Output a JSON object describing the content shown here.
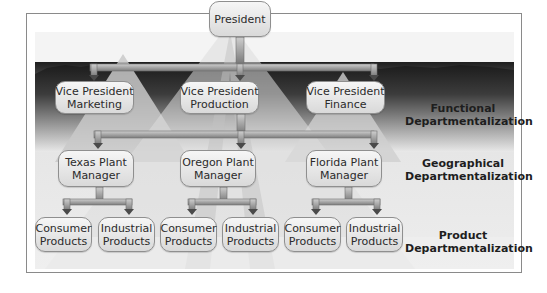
{
  "diagram": {
    "top": {
      "line1": "President"
    },
    "vps": [
      {
        "line1": "Vice President",
        "line2": "Marketing"
      },
      {
        "line1": "Vice President",
        "line2": "Production"
      },
      {
        "line1": "Vice President",
        "line2": "Finance"
      }
    ],
    "plants": [
      {
        "line1": "Texas Plant",
        "line2": "Manager"
      },
      {
        "line1": "Oregon Plant",
        "line2": "Manager"
      },
      {
        "line1": "Florida Plant",
        "line2": "Manager"
      }
    ],
    "products": [
      {
        "line1": "Consumer",
        "line2": "Products"
      },
      {
        "line1": "Industrial",
        "line2": "Products"
      },
      {
        "line1": "Consumer",
        "line2": "Products"
      },
      {
        "line1": "Industrial",
        "line2": "Products"
      },
      {
        "line1": "Consumer",
        "line2": "Products"
      },
      {
        "line1": "Industrial",
        "line2": "Products"
      }
    ],
    "levels": [
      {
        "line1": "Functional",
        "line2": "Departmentalization"
      },
      {
        "line1": "Geographical",
        "line2": "Departmentalization"
      },
      {
        "line1": "Product",
        "line2": "Departmentalization"
      }
    ]
  },
  "colors": {
    "connector": "#8a8a8a",
    "node_fill": "#e4e4e4",
    "node_border": "#8f8f8f",
    "text": "#2b2b2b"
  }
}
